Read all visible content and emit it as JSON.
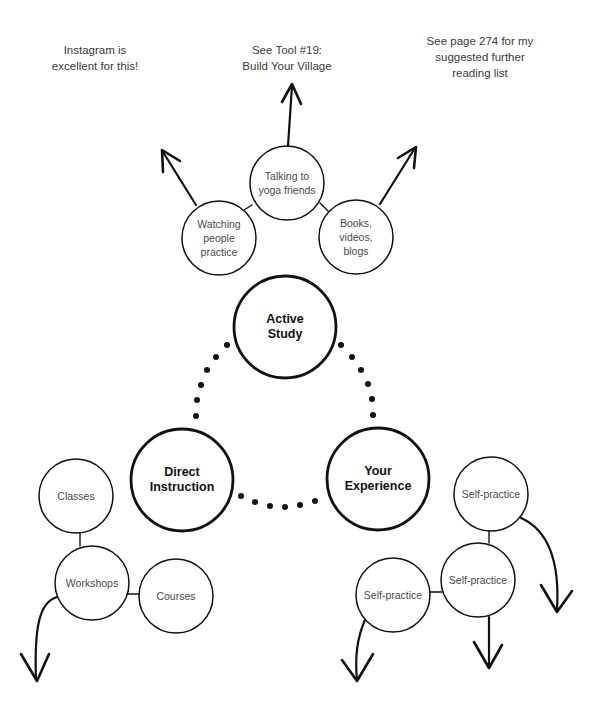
{
  "notes": {
    "instagram": "Instagram is excellent for this!",
    "tool": "See Tool #19: Build Your Village",
    "tool_line1": "See Tool #19:",
    "tool_line2": "Build Your Village",
    "reading": "See page 274 for my suggested further reading list",
    "instagram_line1": "Instagram is",
    "instagram_line2": "excellent for this!",
    "reading_line1": "See page 274 for my",
    "reading_line2": "suggested further",
    "reading_line3": "reading list"
  },
  "main_nodes": {
    "active_study": {
      "line1": "Active",
      "line2": "Study"
    },
    "direct_instruction": {
      "line1": "Direct",
      "line2": "Instruction"
    },
    "your_experience": {
      "line1": "Your",
      "line2": "Experience"
    }
  },
  "active_study_children": {
    "watching": {
      "line1": "Watching",
      "line2": "people",
      "line3": "practice"
    },
    "talking": {
      "line1": "Talking to",
      "line2": "yoga friends"
    },
    "books": {
      "line1": "Books,",
      "line2": "videos,",
      "line3": "blogs"
    }
  },
  "direct_instruction_children": {
    "classes": "Classes",
    "workshops": "Workshops",
    "courses": "Courses"
  },
  "your_experience_children": {
    "top": "Self-practice",
    "middle": "Self-practice",
    "left": "Self-practice"
  },
  "colors": {
    "stroke": "#111111",
    "text": "#4a4a4a",
    "background": "#ffffff"
  }
}
